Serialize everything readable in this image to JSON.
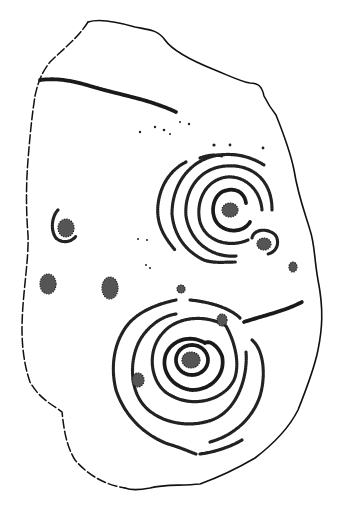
{
  "image": {
    "subject": "rock-carving-drawing",
    "description": "Stippled line drawing of a stone slab with cup-and-ring marks",
    "colors": {
      "background": "#ffffff",
      "ink": "#111111"
    },
    "features": {
      "outline": "stone outline, solid on right, dashed on left",
      "groove": "long incised line near top-left",
      "upper_motif": "cup with concentric rings (upper right)",
      "lower_motif": "cup with concentric rings (lower center)",
      "cups": "isolated cup marks on left and right"
    }
  }
}
